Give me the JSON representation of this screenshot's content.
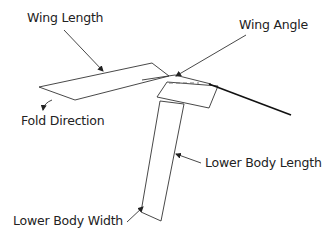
{
  "diagram": {
    "labels": {
      "wing_length": "Wing Length",
      "wing_angle": "Wing Angle",
      "fold_direction": "Fold Direction",
      "lower_body_length": "Lower Body Length",
      "lower_body_width": "Lower Body Width"
    },
    "colors": {
      "stroke": "#222222",
      "dash": "#666666",
      "background": "#ffffff"
    }
  }
}
